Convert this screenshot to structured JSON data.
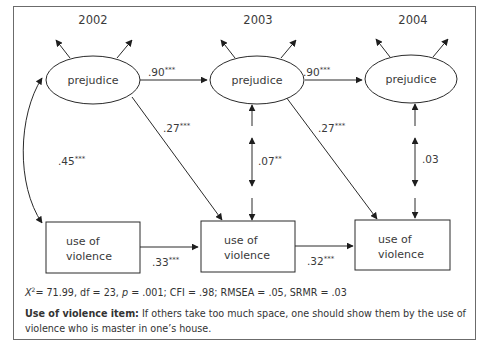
{
  "diagram": {
    "type": "path-model",
    "years": [
      "2002",
      "2003",
      "2004"
    ],
    "latent_nodes": [
      {
        "id": "prej2002",
        "label": "prejudice",
        "year": "2002"
      },
      {
        "id": "prej2003",
        "label": "prejudice",
        "year": "2003"
      },
      {
        "id": "prej2004",
        "label": "prejudice",
        "year": "2004"
      }
    ],
    "observed_nodes": [
      {
        "id": "viol2002",
        "label_line1": "use of",
        "label_line2": "violence"
      },
      {
        "id": "viol2003",
        "label_line1": "use of",
        "label_line2": "violence"
      },
      {
        "id": "viol2004",
        "label_line1": "use of",
        "label_line2": "violence"
      }
    ],
    "paths": [
      {
        "from": "prej2002",
        "to": "prej2003",
        "type": "directed",
        "value": ".90",
        "sig": "***"
      },
      {
        "from": "prej2003",
        "to": "prej2004",
        "type": "directed",
        "value": ".90",
        "sig": "***"
      },
      {
        "from": "prej2002",
        "to": "viol2003",
        "type": "directed",
        "value": ".27",
        "sig": "***"
      },
      {
        "from": "prej2003",
        "to": "viol2004",
        "type": "directed",
        "value": ".27",
        "sig": "***"
      },
      {
        "from": "viol2002",
        "to": "viol2003",
        "type": "directed",
        "value": ".33",
        "sig": "***"
      },
      {
        "from": "viol2003",
        "to": "viol2004",
        "type": "directed",
        "value": ".32",
        "sig": "***"
      },
      {
        "from": "prej2002",
        "to": "viol2002",
        "type": "covariance",
        "value": ".45",
        "sig": "***"
      },
      {
        "from": "prej2003",
        "to": "viol2003",
        "type": "residual-covariance",
        "value": ".07",
        "sig": "**"
      },
      {
        "from": "prej2004",
        "to": "viol2004",
        "type": "residual-covariance",
        "value": ".03",
        "sig": ""
      }
    ]
  },
  "fit": {
    "chi_symbol": "X",
    "chi_sup": "2",
    "chi_value": "= 71.99, df = 23, ",
    "p_symbol": "p",
    "rest": " = .001; CFI = .98; RMSEA = .05, SRMR = .03"
  },
  "note": {
    "bold_label": "Use of violence item:",
    "text": " If others take too much space, one should show them by the use of violence who is master in one’s house."
  }
}
